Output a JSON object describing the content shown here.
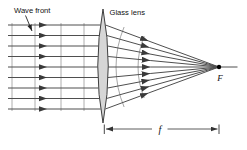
{
  "figure": {
    "labels": {
      "wave_front": "Wave front",
      "glass_lens": "Glass lens",
      "focal_point": "F",
      "focal_length": "f"
    },
    "colors": {
      "background": "#ffffff",
      "ray": "#4f4f4f",
      "arrowhead": "#3a3a3a",
      "wavefront_line": "#9a9a9a",
      "refracted_wavefront_arc": "#8f8f8f",
      "lens_fill": "#d6d6d6",
      "lens_outline": "#3f3f3f",
      "dimension_line": "#333333",
      "leader_arrow": "#222222",
      "text": "#111111",
      "focal_dot": "#000000"
    }
  }
}
